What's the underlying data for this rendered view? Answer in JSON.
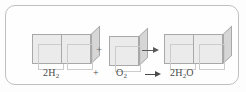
{
  "figure": {
    "kind": "chemical-equation-diagram",
    "caption_equation": "2H2 + O2 -> 2H2O",
    "frame": {
      "border_color": "#bfbfbf",
      "background_color": "#fefefe",
      "corner_radius": "10px"
    },
    "colors": {
      "cube_front": "#ebebeb",
      "cube_top": "#f7f7f7",
      "cube_side": "#d6d6d6",
      "cube_edge": "#a8a8a8",
      "text": "#4a4a4a",
      "arrow": "#4a4a4a"
    }
  },
  "diagram": {
    "reactants": [
      {
        "id": "hydrogen",
        "label_text": "2H",
        "label_sub": "2",
        "cube_count": 2,
        "icon": "cube-pair-icon"
      },
      {
        "id": "oxygen",
        "label_text": "O",
        "label_sub": "2",
        "cube_count": 1,
        "icon": "cube-single-icon"
      }
    ],
    "products": [
      {
        "id": "water",
        "label_prefix": "2H",
        "label_sub": "2",
        "label_suffix": "O",
        "cube_count": 2,
        "icon": "cube-pair-icon"
      }
    ],
    "operators": {
      "plus": "+",
      "arrow_icon": "right-arrow-icon"
    }
  },
  "labels": {
    "hydrogen": "2H",
    "hydrogen_sub": "2",
    "plus": "+",
    "oxygen": "O",
    "oxygen_sub": "2",
    "water_prefix": "2H",
    "water_sub": "2",
    "water_suffix": "O"
  }
}
